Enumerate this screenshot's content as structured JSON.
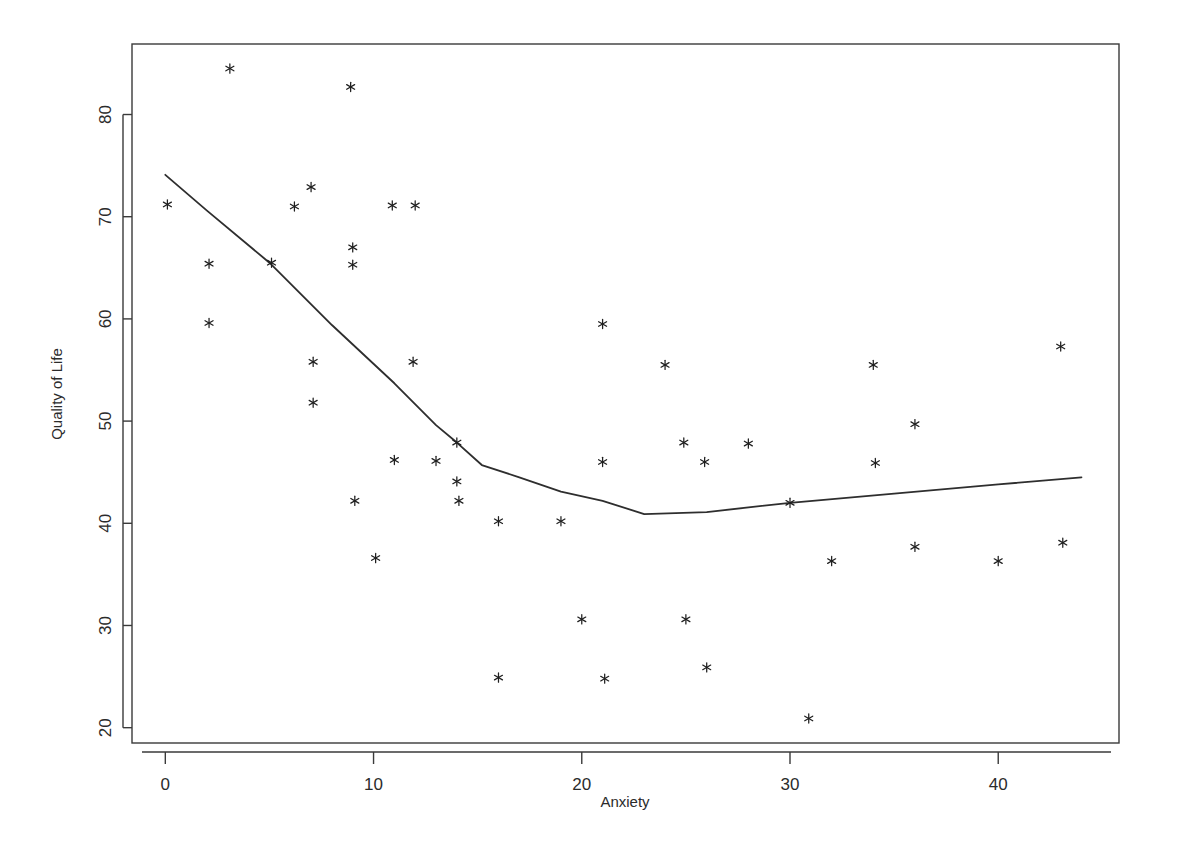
{
  "figure": {
    "background_color": "#ffffff",
    "foreground_color": "#2e2e2e",
    "marker_symbol": "asterisk",
    "xlabel_text": "Anxiety",
    "ylabel_text": "Quality of Life"
  },
  "axes": {
    "x_ticks": [
      "0",
      "10",
      "20",
      "30",
      "40"
    ],
    "y_ticks": [
      "20",
      "30",
      "40",
      "50",
      "60",
      "70",
      "80"
    ]
  },
  "chart_data": {
    "type": "scatter",
    "title": "",
    "subtitle": "",
    "xlabel": "Anxiety",
    "ylabel": "Quality of Life",
    "grid": false,
    "legend": "none",
    "xlim": [
      -1.6,
      45.8
    ],
    "ylim": [
      18.5,
      86.9
    ],
    "x_ticks": [
      0,
      10,
      20,
      30,
      40
    ],
    "y_ticks": [
      20,
      30,
      40,
      50,
      60,
      70,
      80
    ],
    "marker": "asterisk",
    "marker_color": "#1f1f1f",
    "series": [
      {
        "name": "observations",
        "type": "scatter",
        "points": [
          [
            0.1,
            71.2
          ],
          [
            2.1,
            65.4
          ],
          [
            2.1,
            59.6
          ],
          [
            3.1,
            84.5
          ],
          [
            5.1,
            65.5
          ],
          [
            6.2,
            71.0
          ],
          [
            7.0,
            72.9
          ],
          [
            7.1,
            55.8
          ],
          [
            7.1,
            51.8
          ],
          [
            8.9,
            82.7
          ],
          [
            9.0,
            67.0
          ],
          [
            9.0,
            65.3
          ],
          [
            9.1,
            42.2
          ],
          [
            10.1,
            36.6
          ],
          [
            10.9,
            71.1
          ],
          [
            11.0,
            46.2
          ],
          [
            11.9,
            55.8
          ],
          [
            12.0,
            71.1
          ],
          [
            13.0,
            46.1
          ],
          [
            14.0,
            47.9
          ],
          [
            14.0,
            44.1
          ],
          [
            14.1,
            42.2
          ],
          [
            16.0,
            40.2
          ],
          [
            16.0,
            24.9
          ],
          [
            19.0,
            40.2
          ],
          [
            20.0,
            30.6
          ],
          [
            21.0,
            59.5
          ],
          [
            21.0,
            46.0
          ],
          [
            21.1,
            24.8
          ],
          [
            24.0,
            55.5
          ],
          [
            24.9,
            47.9
          ],
          [
            25.0,
            30.6
          ],
          [
            25.9,
            46.0
          ],
          [
            26.0,
            25.9
          ],
          [
            28.0,
            47.8
          ],
          [
            30.0,
            42.0
          ],
          [
            30.9,
            20.9
          ],
          [
            32.0,
            36.3
          ],
          [
            34.0,
            55.5
          ],
          [
            34.1,
            45.9
          ],
          [
            36.0,
            49.7
          ],
          [
            36.0,
            37.7
          ],
          [
            40.0,
            36.3
          ],
          [
            43.0,
            57.3
          ],
          [
            43.1,
            38.1
          ]
        ]
      },
      {
        "name": "lowess-fit",
        "type": "line",
        "points": [
          [
            0.0,
            74.1
          ],
          [
            2.0,
            70.6
          ],
          [
            5.0,
            65.5
          ],
          [
            8.0,
            59.4
          ],
          [
            11.0,
            53.7
          ],
          [
            13.0,
            49.6
          ],
          [
            14.0,
            47.9
          ],
          [
            15.2,
            45.7
          ],
          [
            17.0,
            44.5
          ],
          [
            19.0,
            43.1
          ],
          [
            21.0,
            42.2
          ],
          [
            23.0,
            40.9
          ],
          [
            26.0,
            41.1
          ],
          [
            30.0,
            42.0
          ],
          [
            35.0,
            42.9
          ],
          [
            40.0,
            43.8
          ],
          [
            44.0,
            44.5
          ]
        ]
      }
    ]
  }
}
